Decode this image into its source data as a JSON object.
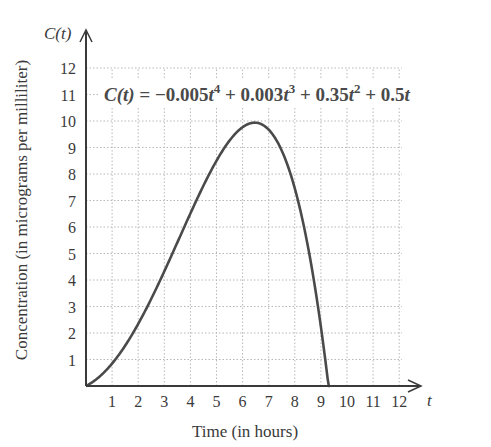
{
  "chart_data": {
    "type": "line",
    "title": "",
    "equation": "C(t) = −0.005t⁴ + 0.003t³ + 0.35t² + 0.5t",
    "equation_parts": {
      "lhs": "C(t) = ",
      "t1_coef": "−0.005",
      "t1_exp": "4",
      "t2_coef": " + 0.003",
      "t2_exp": "3",
      "t3_coef": " + 0.35",
      "t3_exp": "2",
      "t4_coef": " + 0.5",
      "var": "t"
    },
    "xlabel": "Time (in hours)",
    "ylabel": "Concentration (in micrograms per milliliter)",
    "x_axis_symbol": "t",
    "y_axis_symbol": "C(t)",
    "xlim": [
      0,
      12.8
    ],
    "ylim": [
      0,
      12.8
    ],
    "x_ticks": [
      1,
      2,
      3,
      4,
      5,
      6,
      7,
      8,
      9,
      10,
      11,
      12
    ],
    "y_ticks": [
      1,
      2,
      3,
      4,
      5,
      6,
      7,
      8,
      9,
      10,
      11,
      12
    ],
    "grid": true,
    "grid_style": "dotted",
    "series": [
      {
        "name": "C(t)",
        "coefficients": {
          "t4": -0.005,
          "t3": 0.003,
          "t2": 0.35,
          "t1": 0.5,
          "t0": 0
        },
        "domain": [
          0,
          9.35
        ],
        "x": [
          0,
          1,
          2,
          3,
          4,
          5,
          6,
          6.5,
          7,
          8,
          9,
          9.35
        ],
        "values": [
          0,
          0.85,
          2.34,
          4.29,
          6.47,
          8.55,
          9.97,
          10.14,
          10.02,
          8.18,
          3.16,
          0
        ]
      }
    ],
    "line_color": "#4a4a4a",
    "grid_color": "#b8b8b8",
    "axis_color": "#3a3a3a"
  }
}
